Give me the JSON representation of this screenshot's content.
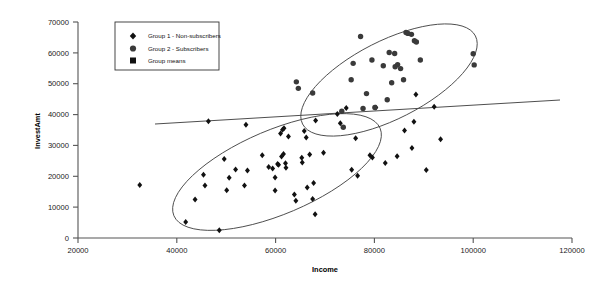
{
  "chart_data": {
    "type": "scatter",
    "title": "",
    "xlabel": "Income",
    "ylabel": "InvestAmt",
    "xlim": [
      20000,
      120000
    ],
    "ylim": [
      0,
      70000
    ],
    "xticks": [
      20000,
      40000,
      60000,
      80000,
      100000,
      120000
    ],
    "yticks": [
      0,
      10000,
      20000,
      30000,
      40000,
      50000,
      60000,
      70000
    ],
    "xtick_labels": [
      "20000",
      "40000",
      "60000",
      "80000",
      "100000",
      "120000"
    ],
    "ytick_labels": [
      "0",
      "10000",
      "20000",
      "30000",
      "40000",
      "50000",
      "60000",
      "70000"
    ],
    "grid": false,
    "legend_position": "top-left",
    "legend": [
      {
        "marker": "diamond",
        "label": "Group 1 - Non-subscribers"
      },
      {
        "marker": "circle",
        "label": "Group 2 - Subscribers"
      },
      {
        "marker": "square",
        "label": "Group means"
      }
    ],
    "series": [
      {
        "name": "Group 1 - Non-subscribers",
        "marker": "diamond",
        "color": "#111111",
        "points": [
          [
            32500,
            17200
          ],
          [
            41800,
            5200
          ],
          [
            43700,
            12500
          ],
          [
            45400,
            20500
          ],
          [
            45700,
            17000
          ],
          [
            46400,
            37800
          ],
          [
            48600,
            2500
          ],
          [
            49600,
            25600
          ],
          [
            50100,
            15500
          ],
          [
            50600,
            19500
          ],
          [
            51900,
            22200
          ],
          [
            53700,
            17000
          ],
          [
            54000,
            36700
          ],
          [
            54300,
            21900
          ],
          [
            57300,
            26800
          ],
          [
            58600,
            23000
          ],
          [
            59400,
            22500
          ],
          [
            59900,
            19600
          ],
          [
            59900,
            15400
          ],
          [
            60400,
            24000
          ],
          [
            60600,
            23700
          ],
          [
            61000,
            33900
          ],
          [
            61200,
            26400
          ],
          [
            61400,
            35100
          ],
          [
            61600,
            27200
          ],
          [
            61700,
            35600
          ],
          [
            62000,
            24200
          ],
          [
            62100,
            22800
          ],
          [
            62600,
            32900
          ],
          [
            63800,
            14100
          ],
          [
            64100,
            12100
          ],
          [
            65300,
            26000
          ],
          [
            65400,
            24500
          ],
          [
            65800,
            34700
          ],
          [
            66200,
            32600
          ],
          [
            66400,
            16400
          ],
          [
            66900,
            27100
          ],
          [
            67500,
            12600
          ],
          [
            67700,
            17800
          ],
          [
            68000,
            7700
          ],
          [
            68100,
            38100
          ],
          [
            69700,
            27600
          ],
          [
            72500,
            40200
          ],
          [
            73100,
            37200
          ],
          [
            74300,
            42100
          ],
          [
            75400,
            22100
          ],
          [
            76200,
            32300
          ],
          [
            76600,
            20200
          ],
          [
            79100,
            26800
          ],
          [
            79600,
            26100
          ],
          [
            80300,
            42300
          ],
          [
            82200,
            24300
          ],
          [
            84600,
            26500
          ],
          [
            86100,
            34800
          ],
          [
            87600,
            29200
          ],
          [
            88000,
            37700
          ],
          [
            88400,
            46500
          ],
          [
            90500,
            22000
          ],
          [
            92100,
            42500
          ],
          [
            93400,
            32000
          ]
        ]
      },
      {
        "name": "Group 2 - Subscribers",
        "marker": "circle",
        "color": "#3a3a3a",
        "points": [
          [
            64200,
            50600
          ],
          [
            64600,
            48500
          ],
          [
            67500,
            47000
          ],
          [
            73400,
            41100
          ],
          [
            73700,
            35900
          ],
          [
            75300,
            51300
          ],
          [
            75700,
            56600
          ],
          [
            77200,
            65300
          ],
          [
            77700,
            42000
          ],
          [
            78400,
            46800
          ],
          [
            79500,
            57700
          ],
          [
            80100,
            42300
          ],
          [
            81800,
            55800
          ],
          [
            82600,
            44800
          ],
          [
            83000,
            60100
          ],
          [
            83500,
            50300
          ],
          [
            84100,
            59800
          ],
          [
            84200,
            55500
          ],
          [
            84700,
            56200
          ],
          [
            85300,
            54900
          ],
          [
            85900,
            51300
          ],
          [
            86400,
            66600
          ],
          [
            86800,
            66300
          ],
          [
            87500,
            66000
          ],
          [
            88100,
            63900
          ],
          [
            88500,
            63500
          ],
          [
            89300,
            57700
          ],
          [
            100000,
            59700
          ],
          [
            100200,
            56100
          ]
        ]
      }
    ],
    "ellipses": [
      {
        "label": "Group 1 envelope",
        "cx_px": 277,
        "cy_px": 172,
        "rx_px": 112,
        "ry_px": 42,
        "rotation_deg": -23
      },
      {
        "label": "Group 2 envelope",
        "cx_px": 389,
        "cy_px": 80,
        "rx_px": 97,
        "ry_px": 39,
        "rotation_deg": -27
      }
    ],
    "regression_line": {
      "label": "overall trend line",
      "x_start": 35600,
      "y_start": 37000,
      "x_end": 118000,
      "y_end": 44800
    },
    "annotations": []
  }
}
